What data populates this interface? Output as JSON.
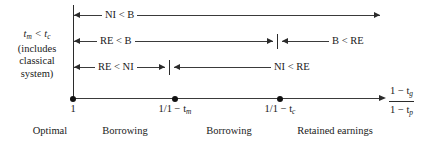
{
  "figure": {
    "left_label": {
      "line1_prefix": "t",
      "line1_sub1": "m",
      "line1_mid": " < t",
      "line1_sub2": "c",
      "line2": "(includes",
      "line3": "classical",
      "line4": "system)"
    },
    "relations": [
      {
        "name": "ni-lt-b",
        "label": "NI < B"
      },
      {
        "name": "re-lt-b",
        "label": "RE < B"
      },
      {
        "name": "b-lt-re",
        "label": "B < RE"
      },
      {
        "name": "re-lt-ni",
        "label": "RE < NI"
      },
      {
        "name": "ni-lt-re",
        "label": "NI < RE"
      }
    ],
    "axis": {
      "ticks": [
        {
          "name": "tick-one",
          "label": "1"
        },
        {
          "name": "tick-tm",
          "label_prefix": "1/1 − t",
          "label_sub": "m"
        },
        {
          "name": "tick-tc",
          "label_prefix": "1/1 − t",
          "label_sub": "c"
        }
      ],
      "variable": {
        "numerator_prefix": "1 − t",
        "numerator_sub": "g",
        "denominator_prefix": "1 − t",
        "denominator_sub": "p"
      }
    },
    "regions": [
      {
        "name": "region-optimal",
        "label": "Optimal"
      },
      {
        "name": "region-borrowing-1",
        "label": "Borrowing"
      },
      {
        "name": "region-borrowing-2",
        "label": "Borrowing"
      },
      {
        "name": "region-retained-earnings",
        "label": "Retained earnings"
      }
    ],
    "colors": {
      "ink": "#1a1a1a",
      "rule": "#3a3a3a",
      "background": "#ffffff"
    }
  }
}
